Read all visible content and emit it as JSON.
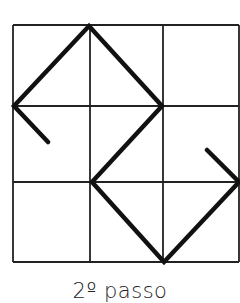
{
  "caption": "2º passo",
  "grid": {
    "rows": 3,
    "cols": 3,
    "x_lines": [
      13,
      90,
      163,
      239
    ],
    "y_lines": [
      25,
      106,
      182,
      262
    ],
    "line_color": "#222222",
    "line_width": 1.8
  },
  "path": {
    "stroke_color": "#111111",
    "stroke_width": 4.5,
    "points": [
      [
        48,
        142
      ],
      [
        14,
        106
      ],
      [
        89,
        26
      ],
      [
        162,
        106
      ],
      [
        92,
        182
      ],
      [
        164,
        262
      ],
      [
        239,
        182
      ],
      [
        207,
        150
      ]
    ]
  }
}
